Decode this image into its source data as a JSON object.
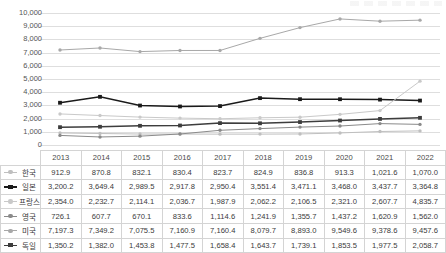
{
  "chart_data": {
    "type": "line",
    "title": "",
    "xlabel": "",
    "ylabel": "",
    "ylim": [
      0,
      10000
    ],
    "ytick_step": 1000,
    "grid": true,
    "legend": "table-row-labels",
    "categories": [
      "2013",
      "2014",
      "2015",
      "2016",
      "2017",
      "2018",
      "2019",
      "2020",
      "2021",
      "2022"
    ],
    "ytick_labels": [
      "10,000",
      "9,000",
      "8,000",
      "7,000",
      "6,000",
      "5,000",
      "4,000",
      "3,000",
      "2,000",
      "1,000",
      "0"
    ],
    "series": [
      {
        "name": "한국",
        "color": "#bfbfbf",
        "marker": "dot",
        "values": [
          912.9,
          870.8,
          832.1,
          830.4,
          823.7,
          824.9,
          836.8,
          913.3,
          1021.6,
          1070.0
        ],
        "labels": [
          "912.9",
          "870.8",
          "832.1",
          "830.4",
          "823.7",
          "824.9",
          "836.8",
          "913.3",
          "1,021.6",
          "1,070.0"
        ]
      },
      {
        "name": "일본",
        "color": "#1a1a1a",
        "marker": "square",
        "values": [
          3200.2,
          3649.4,
          2989.5,
          2917.8,
          2950.4,
          3551.4,
          3471.1,
          3468.0,
          3437.7,
          3364.8
        ],
        "labels": [
          "3,200.2",
          "3,649.4",
          "2,989.5",
          "2,917.8",
          "2,950.4",
          "3,551.4",
          "3,471.1",
          "3,468.0",
          "3,437.7",
          "3,364.8"
        ]
      },
      {
        "name": "프랑스",
        "color": "#c9c9c9",
        "marker": "dot",
        "values": [
          2354.0,
          2232.7,
          2114.1,
          2036.7,
          1987.9,
          2062.2,
          2106.5,
          2321.0,
          2607.7,
          4835.7
        ],
        "labels": [
          "2,354.0",
          "2,232.7",
          "2,114.1",
          "2,036.7",
          "1,987.9",
          "2,062.2",
          "2,106.5",
          "2,321.0",
          "2,607.7",
          "4,835.7"
        ]
      },
      {
        "name": "영국",
        "color": "#8a8a8a",
        "marker": "dot",
        "values": [
          726.1,
          607.7,
          670.1,
          833.6,
          1114.6,
          1241.9,
          1355.7,
          1437.2,
          1620.9,
          1562.0
        ],
        "labels": [
          "726.1",
          "607.7",
          "670.1",
          "833.6",
          "1,114.6",
          "1,241.9",
          "1,355.7",
          "1,437.2",
          "1,620.9",
          "1,562.0"
        ]
      },
      {
        "name": "미국",
        "color": "#a8a8a8",
        "marker": "dot",
        "values": [
          7197.3,
          7349.2,
          7075.5,
          7160.9,
          7160.4,
          8079.7,
          8893.0,
          9549.6,
          9378.6,
          9457.6
        ],
        "labels": [
          "7,197.3",
          "7,349.2",
          "7,075.5",
          "7,160.9",
          "7,160.4",
          "8,079.7",
          "8,893.0",
          "9,549.6",
          "9,378.6",
          "9,457.6"
        ]
      },
      {
        "name": "독일",
        "color": "#3d3d3d",
        "marker": "square",
        "values": [
          1350.2,
          1382.0,
          1453.8,
          1477.5,
          1658.4,
          1643.7,
          1739.1,
          1853.5,
          1977.5,
          2058.7
        ],
        "labels": [
          "1,350.2",
          "1,382.0",
          "1,453.8",
          "1,477.5",
          "1,658.4",
          "1,643.7",
          "1,739.1",
          "1,853.5",
          "1,977.5",
          "2,058.7"
        ]
      }
    ]
  },
  "table": {
    "corner_label": "",
    "columns": [
      "2013",
      "2014",
      "2015",
      "2016",
      "2017",
      "2018",
      "2019",
      "2020",
      "2021",
      "2022"
    ],
    "rows": [
      {
        "name": "한국",
        "values": [
          "912.9",
          "870.8",
          "832.1",
          "830.4",
          "823.7",
          "824.9",
          "836.8",
          "913.3",
          "1,021.6",
          "1,070.0"
        ]
      },
      {
        "name": "일본",
        "values": [
          "3,200.2",
          "3,649.4",
          "2,989.5",
          "2,917.8",
          "2,950.4",
          "3,551.4",
          "3,471.1",
          "3,468.0",
          "3,437.7",
          "3,364.8"
        ]
      },
      {
        "name": "프랑스",
        "values": [
          "2,354.0",
          "2,232.7",
          "2,114.1",
          "2,036.7",
          "1,987.9",
          "2,062.2",
          "2,106.5",
          "2,321.0",
          "2,607.7",
          "4,835.7"
        ]
      },
      {
        "name": "영국",
        "values": [
          "726.1",
          "607.7",
          "670.1",
          "833.6",
          "1,114.6",
          "1,241.9",
          "1,355.7",
          "1,437.2",
          "1,620.9",
          "1,562.0"
        ]
      },
      {
        "name": "미국",
        "values": [
          "7,197.3",
          "7,349.2",
          "7,075.5",
          "7,160.9",
          "7,160.4",
          "8,079.7",
          "8,893.0",
          "9,549.6",
          "9,378.6",
          "9,457.6"
        ]
      },
      {
        "name": "독일",
        "values": [
          "1,350.2",
          "1,382.0",
          "1,453.8",
          "1,477.5",
          "1,658.4",
          "1,643.7",
          "1,739.1",
          "1,853.5",
          "1,977.5",
          "2,058.7"
        ]
      }
    ]
  }
}
